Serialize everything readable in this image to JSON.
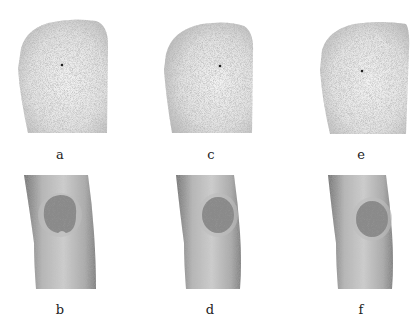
{
  "figure": {
    "panels": [
      {
        "id": "a",
        "label": "a",
        "kind": "point-cloud",
        "row": 1,
        "col": 1
      },
      {
        "id": "c",
        "label": "c",
        "kind": "point-cloud",
        "row": 1,
        "col": 2
      },
      {
        "id": "e",
        "label": "e",
        "kind": "point-cloud",
        "row": 1,
        "col": 3
      },
      {
        "id": "b",
        "label": "b",
        "kind": "textured-knee",
        "row": 2,
        "col": 1
      },
      {
        "id": "d",
        "label": "d",
        "kind": "textured-knee",
        "row": 2,
        "col": 2
      },
      {
        "id": "f",
        "label": "f",
        "kind": "textured-knee",
        "row": 2,
        "col": 3
      }
    ]
  },
  "colors": {
    "background": "#ffffff",
    "point_cloud": "#8a8a8a",
    "skin_light": "#cfcfcf",
    "skin_dark": "#7a7a7a",
    "patch": "#6a6a6a",
    "marker_dot": "#222222"
  }
}
